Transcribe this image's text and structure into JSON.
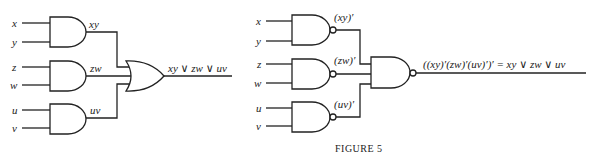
{
  "left_circuit": {
    "inputs": [
      "x",
      "y",
      "z",
      "w",
      "u",
      "v"
    ],
    "gate_outputs": [
      "xy",
      "zw",
      "uv"
    ],
    "gate_types": [
      "AND",
      "AND",
      "AND",
      "OR"
    ],
    "output": "xy ∨ zw ∨ uv"
  },
  "right_circuit": {
    "inputs": [
      "x",
      "y",
      "z",
      "w",
      "u",
      "v"
    ],
    "gate_outputs": [
      "(xy)′",
      "(zw)′",
      "(uv)′"
    ],
    "gate_types": [
      "NAND",
      "NAND",
      "NAND",
      "NAND"
    ],
    "output": "((xy)′(zw)′(uv)′)′ = xy ∨ zw ∨ uv"
  },
  "caption": "FIGURE 5"
}
